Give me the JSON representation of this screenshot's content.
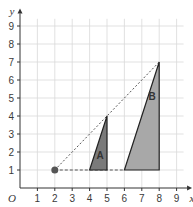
{
  "diagram": {
    "type": "enlargement-on-grid",
    "axes": {
      "x_label": "x",
      "y_label": "y",
      "origin_label": "O",
      "x_ticks": [
        "1",
        "2",
        "3",
        "4",
        "5",
        "6",
        "7",
        "8",
        "9"
      ],
      "y_ticks": [
        "1",
        "2",
        "3",
        "4",
        "5",
        "6",
        "7",
        "8",
        "9"
      ],
      "x_range": [
        0,
        9
      ],
      "y_range": [
        0,
        9
      ]
    },
    "centre_point": {
      "x": 2,
      "y": 1,
      "color": "#555555"
    },
    "shapes": [
      {
        "label": "A",
        "vertices": [
          [
            4,
            1
          ],
          [
            5,
            1
          ],
          [
            5,
            4
          ]
        ],
        "fill": "#7a7a7a"
      },
      {
        "label": "B",
        "vertices": [
          [
            6,
            1
          ],
          [
            8,
            1
          ],
          [
            8,
            7
          ]
        ],
        "fill": "#a8a8a8"
      }
    ],
    "construction_lines": [
      {
        "from": [
          2,
          1
        ],
        "to": [
          8,
          7
        ],
        "style": "dotted"
      },
      {
        "from": [
          2,
          1
        ],
        "to": [
          6,
          1
        ],
        "style": "dashed"
      }
    ],
    "colors": {
      "grid": "#d9d9d9",
      "axis": "#333333",
      "outline": "#222222"
    }
  }
}
